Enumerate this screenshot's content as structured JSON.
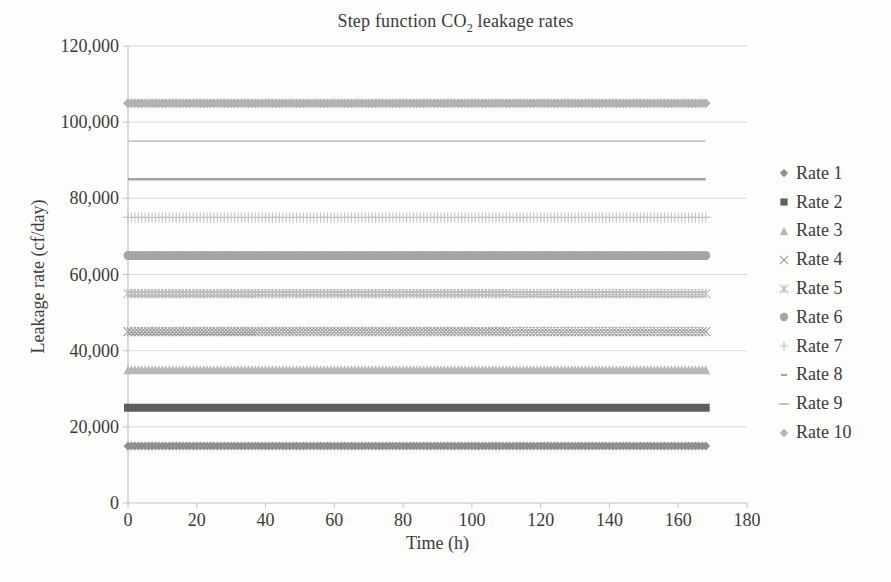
{
  "figure": {
    "title_parts": {
      "pre": "Step function CO",
      "sub": "2",
      "post": " leakage rates"
    }
  },
  "chart_data": {
    "type": "scatter",
    "title": "Step function CO2 leakage rates",
    "xlabel": "Time (h)",
    "ylabel": "Leakage rate (cf/day)",
    "xlim": [
      0,
      180
    ],
    "ylim": [
      0,
      120000
    ],
    "x_ticks": [
      0,
      20,
      40,
      60,
      80,
      100,
      120,
      140,
      160,
      180
    ],
    "y_ticks": [
      0,
      20000,
      40000,
      60000,
      80000,
      100000,
      120000
    ],
    "grid": "horizontal-major-only",
    "legend_position": "right",
    "time_span_hours": [
      0,
      168
    ],
    "marker_step_hours": 1,
    "series": [
      {
        "name": "Rate 1",
        "value": 15000,
        "marker": "diamond",
        "color": "#8f8f8f",
        "size": 4.5
      },
      {
        "name": "Rate 2",
        "value": 25000,
        "marker": "square",
        "color": "#5f5f5f",
        "size": 4.0
      },
      {
        "name": "Rate 3",
        "value": 35000,
        "marker": "triangle",
        "color": "#b7b7b7",
        "size": 4.5
      },
      {
        "name": "Rate 4",
        "value": 45000,
        "marker": "x",
        "color": "#9b9b9b",
        "size": 4.5
      },
      {
        "name": "Rate 5",
        "value": 55000,
        "marker": "star",
        "color": "#bababa",
        "size": 4.5
      },
      {
        "name": "Rate 6",
        "value": 65000,
        "marker": "circle",
        "color": "#a4a4a4",
        "size": 4.5
      },
      {
        "name": "Rate 7",
        "value": 75000,
        "marker": "plus",
        "color": "#c3c3c3",
        "size": 5.0
      },
      {
        "name": "Rate 8",
        "value": 85000,
        "marker": "dash",
        "color": "#a3a3a3",
        "size": 2.6
      },
      {
        "name": "Rate 9",
        "value": 95000,
        "marker": "long-dash",
        "color": "#c6c6c6",
        "size": 1.8
      },
      {
        "name": "Rate 10",
        "value": 105000,
        "marker": "diamond",
        "color": "#b2b2b2",
        "size": 5.0
      }
    ],
    "colors": {
      "grid": "#d9d9d9",
      "axis": "#c2c2c2",
      "text": "#3a3a3a"
    }
  }
}
